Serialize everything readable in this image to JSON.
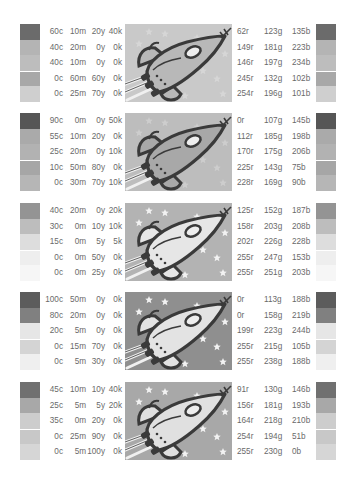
{
  "blocks": [
    {
      "bg": "#c9c9c9",
      "stars": false,
      "rocket_body": "#b8b8b8",
      "rows": [
        {
          "c": "60c",
          "m": "10m",
          "y": "20y",
          "k": "40k",
          "r": "62r",
          "g": "123g",
          "b": "135b",
          "gray": "#6b6b6b"
        },
        {
          "c": "40c",
          "m": "20m",
          "y": "0y",
          "k": "0k",
          "r": "149r",
          "g": "181g",
          "b": "223b",
          "gray": "#b4b4b4"
        },
        {
          "c": "40c",
          "m": "10m",
          "y": "0y",
          "k": "0k",
          "r": "146r",
          "g": "197g",
          "b": "234b",
          "gray": "#bdbdbd"
        },
        {
          "c": "0c",
          "m": "60m",
          "y": "60y",
          "k": "0k",
          "r": "245r",
          "g": "132g",
          "b": "102b",
          "gray": "#a8a8a8"
        },
        {
          "c": "0c",
          "m": "25m",
          "y": "70y",
          "k": "0k",
          "r": "254r",
          "g": "196g",
          "b": "101b",
          "gray": "#cfcfcf"
        }
      ]
    },
    {
      "bg": "#bdbdbd",
      "stars": false,
      "rocket_body": "#a8a8a8",
      "rows": [
        {
          "c": "90c",
          "m": "0m",
          "y": "0y",
          "k": "50k",
          "r": "0r",
          "g": "107g",
          "b": "145b",
          "gray": "#565656"
        },
        {
          "c": "55c",
          "m": "10m",
          "y": "20y",
          "k": "0k",
          "r": "112r",
          "g": "185g",
          "b": "198b",
          "gray": "#aaaaaa"
        },
        {
          "c": "25c",
          "m": "20m",
          "y": "0y",
          "k": "10k",
          "r": "170r",
          "g": "175g",
          "b": "206b",
          "gray": "#b2b2b2"
        },
        {
          "c": "10c",
          "m": "50m",
          "y": "80y",
          "k": "0k",
          "r": "225r",
          "g": "143g",
          "b": "75b",
          "gray": "#a6a6a6"
        },
        {
          "c": "0c",
          "m": "30m",
          "y": "70y",
          "k": "10k",
          "r": "228r",
          "g": "169g",
          "b": "90b",
          "gray": "#b6b6b6"
        }
      ]
    },
    {
      "bg": "#b3b3b3",
      "stars": true,
      "rocket_body": "#e6e6e6",
      "rows": [
        {
          "c": "40c",
          "m": "20m",
          "y": "0y",
          "k": "20k",
          "r": "125r",
          "g": "152g",
          "b": "187b",
          "gray": "#949494"
        },
        {
          "c": "30c",
          "m": "0m",
          "y": "10y",
          "k": "10k",
          "r": "158r",
          "g": "203g",
          "b": "208b",
          "gray": "#bdbdbd"
        },
        {
          "c": "15c",
          "m": "0m",
          "y": "5y",
          "k": "5k",
          "r": "202r",
          "g": "226g",
          "b": "228b",
          "gray": "#dddddd"
        },
        {
          "c": "0c",
          "m": "0m",
          "y": "50y",
          "k": "0k",
          "r": "255r",
          "g": "247g",
          "b": "153b",
          "gray": "#eeeeee"
        },
        {
          "c": "0c",
          "m": "0m",
          "y": "25y",
          "k": "0k",
          "r": "255r",
          "g": "251g",
          "b": "203b",
          "gray": "#f6f6f6"
        }
      ]
    },
    {
      "bg": "#8f8f8f",
      "stars": true,
      "rocket_body": "#e3e3e3",
      "rows": [
        {
          "c": "100c",
          "m": "50m",
          "y": "0y",
          "k": "0k",
          "r": "0r",
          "g": "113g",
          "b": "188b",
          "gray": "#5c5c5c"
        },
        {
          "c": "80c",
          "m": "20m",
          "y": "0y",
          "k": "0k",
          "r": "0r",
          "g": "158g",
          "b": "219b",
          "gray": "#808080"
        },
        {
          "c": "20c",
          "m": "5m",
          "y": "0y",
          "k": "0k",
          "r": "199r",
          "g": "223g",
          "b": "244b",
          "gray": "#e6e6e6"
        },
        {
          "c": "0c",
          "m": "15m",
          "y": "70y",
          "k": "0k",
          "r": "255r",
          "g": "215g",
          "b": "105b",
          "gray": "#d4d4d4"
        },
        {
          "c": "0c",
          "m": "5m",
          "y": "30y",
          "k": "0k",
          "r": "255r",
          "g": "238g",
          "b": "188b",
          "gray": "#efefef"
        }
      ]
    },
    {
      "bg": "#a8a8a8",
      "stars": true,
      "rocket_body": "#e0e0e0",
      "rows": [
        {
          "c": "45c",
          "m": "10m",
          "y": "10y",
          "k": "40k",
          "r": "91r",
          "g": "130g",
          "b": "146b",
          "gray": "#707070"
        },
        {
          "c": "25c",
          "m": "5m",
          "y": "5y",
          "k": "20k",
          "r": "156r",
          "g": "181g",
          "b": "193b",
          "gray": "#a8a8a8"
        },
        {
          "c": "35c",
          "m": "0m",
          "y": "20y",
          "k": "0k",
          "r": "164r",
          "g": "218g",
          "b": "210b",
          "gray": "#cdcdcd"
        },
        {
          "c": "0c",
          "m": "25m",
          "y": "90y",
          "k": "0k",
          "r": "254r",
          "g": "194g",
          "b": "51b",
          "gray": "#c8c8c8"
        },
        {
          "c": "0c",
          "m": "5m",
          "y": "100y",
          "k": "0k",
          "r": "255r",
          "g": "230g",
          "b": "0b",
          "gray": "#d6d6d6"
        }
      ]
    }
  ],
  "block_tops": [
    24,
    113,
    203,
    292,
    382
  ]
}
